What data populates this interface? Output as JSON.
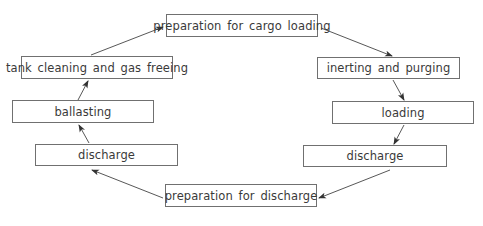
{
  "diagram": {
    "type": "cycle-flowchart",
    "nodes": [
      {
        "id": "prep_loading",
        "label": "preparation for cargo loading",
        "x": 166,
        "y": 14,
        "w": 152,
        "h": 23
      },
      {
        "id": "inerting",
        "label": "inerting and purging",
        "x": 317,
        "y": 57,
        "w": 143,
        "h": 22
      },
      {
        "id": "loading",
        "label": "loading",
        "x": 332,
        "y": 101,
        "w": 142,
        "h": 23
      },
      {
        "id": "discharge_right",
        "label": "discharge",
        "x": 303,
        "y": 145,
        "w": 144,
        "h": 22
      },
      {
        "id": "prep_discharge",
        "label": "preparation for discharge",
        "x": 165,
        "y": 184,
        "w": 152,
        "h": 23
      },
      {
        "id": "discharge_left",
        "label": "discharge",
        "x": 35,
        "y": 144,
        "w": 143,
        "h": 22
      },
      {
        "id": "ballasting",
        "label": "ballasting",
        "x": 12,
        "y": 100,
        "w": 142,
        "h": 23
      },
      {
        "id": "tank_cleaning",
        "label": "tank cleaning and gas freeing",
        "x": 21,
        "y": 56,
        "w": 152,
        "h": 23
      }
    ],
    "edges": [
      {
        "from": "prep_loading",
        "to": "inerting"
      },
      {
        "from": "inerting",
        "to": "loading"
      },
      {
        "from": "loading",
        "to": "discharge_right"
      },
      {
        "from": "discharge_right",
        "to": "prep_discharge"
      },
      {
        "from": "prep_discharge",
        "to": "discharge_left"
      },
      {
        "from": "discharge_left",
        "to": "ballasting"
      },
      {
        "from": "ballasting",
        "to": "tank_cleaning"
      },
      {
        "from": "tank_cleaning",
        "to": "prep_loading"
      }
    ],
    "colors": {
      "border": "#707070",
      "arrow": "#333333",
      "text": "#3a3a3a"
    }
  }
}
